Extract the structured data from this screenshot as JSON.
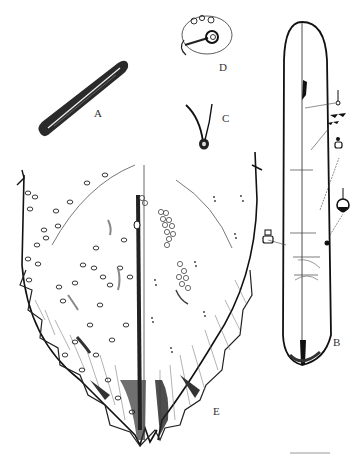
{
  "figure": {
    "panels": [
      {
        "id": "A",
        "label": "A",
        "description": "elongate dark cylindrical structure with central slit"
      },
      {
        "id": "B",
        "label": "B",
        "description": "whole body outline, elongate, with enlarged pore/seta insets"
      },
      {
        "id": "C",
        "label": "C",
        "description": "curved seta with basal socket"
      },
      {
        "id": "D",
        "label": "D",
        "description": "oval pore with three small pores and duct"
      },
      {
        "id": "E",
        "label": "E",
        "description": "pygidium detail, left dorsal and right ventral halves"
      }
    ],
    "colors": {
      "ink": "#1a1a1a",
      "paper": "#ffffff",
      "hatch": "#555555"
    }
  }
}
